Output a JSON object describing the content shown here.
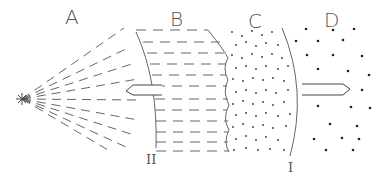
{
  "diagram": {
    "regions": [
      {
        "id": "A",
        "label": "A",
        "fill": "radiating-dashes"
      },
      {
        "id": "B",
        "label": "B",
        "fill": "horizontal-dashes"
      },
      {
        "id": "C",
        "label": "C",
        "fill": "dense-dots"
      },
      {
        "id": "D",
        "label": "D",
        "fill": "sparse-dots"
      }
    ],
    "boundaries": [
      {
        "id": "II",
        "label": "II",
        "between": "A-B"
      },
      {
        "id": "I",
        "label": "I",
        "between": "C-D"
      }
    ],
    "source_marker": "*",
    "arrows": [
      {
        "id": "left-arrow",
        "direction": "left",
        "region": "B"
      },
      {
        "id": "right-arrow",
        "direction": "right",
        "region": "D"
      }
    ],
    "colors": {
      "line": "#555555",
      "dot": "#222222",
      "background": "#ffffff"
    }
  }
}
